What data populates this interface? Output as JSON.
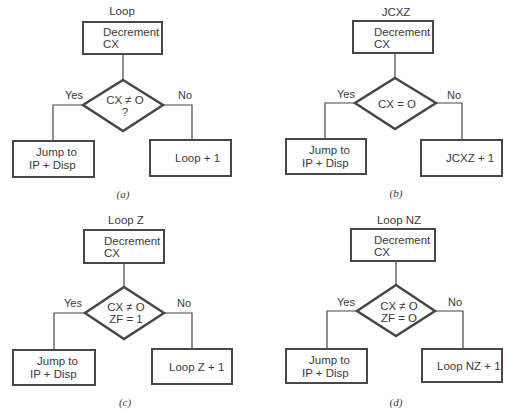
{
  "figure": {
    "panels": [
      {
        "id": "a",
        "title": "Loop",
        "process_box": {
          "line1": "Decrement",
          "line2": "CX"
        },
        "decision": {
          "line1": "CX ≠ O",
          "line2": "?"
        },
        "yes_label": "Yes",
        "no_label": "No",
        "yes_box": {
          "line1": "Jump to",
          "line2": "IP + Disp"
        },
        "no_box": {
          "line1": "Loop + 1"
        },
        "caption": "(a)"
      },
      {
        "id": "b",
        "title": "JCXZ",
        "process_box": {
          "line1": "Decrement",
          "line2": "CX"
        },
        "decision": {
          "line1": "CX = O",
          "line2": ""
        },
        "yes_label": "Yes",
        "no_label": "No",
        "yes_box": {
          "line1": "Jump to",
          "line2": "IP + Disp"
        },
        "no_box": {
          "line1": "JCXZ + 1"
        },
        "caption": "(b)"
      },
      {
        "id": "c",
        "title": "Loop Z",
        "process_box": {
          "line1": "Decrement",
          "line2": "CX"
        },
        "decision": {
          "line1": "CX ≠ O",
          "line2": "ZF = 1"
        },
        "yes_label": "Yes",
        "no_label": "No",
        "yes_box": {
          "line1": "Jump to",
          "line2": "IP + Disp"
        },
        "no_box": {
          "line1": "Loop Z + 1"
        },
        "caption": "(c)"
      },
      {
        "id": "d",
        "title": "Loop NZ",
        "process_box": {
          "line1": "Decrement",
          "line2": "CX"
        },
        "decision": {
          "line1": "CX ≠ O",
          "line2": "ZF = O"
        },
        "yes_label": "Yes",
        "no_label": "No",
        "yes_box": {
          "line1": "Jump to",
          "line2": "IP + Disp"
        },
        "no_box": {
          "line1": "Loop NZ + 1"
        },
        "caption": "(d)"
      }
    ]
  },
  "colors": {
    "stroke": "#474747",
    "text": "#3a3a3a",
    "background": "#ffffff"
  }
}
